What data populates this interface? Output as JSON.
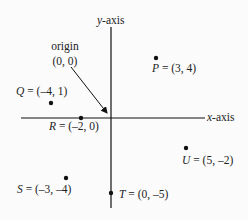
{
  "diagram": {
    "type": "coordinate-plane",
    "x_axis_label": "x-axis",
    "y_axis_label": "y-axis",
    "origin": {
      "label": "origin",
      "coords": "(0, 0)"
    },
    "scale_px_per_unit": 15,
    "origin_px": [
      111,
      118
    ],
    "points": [
      {
        "name": "P",
        "x": 3,
        "y": 4,
        "label_suffix": " = (3, 4)"
      },
      {
        "name": "Q",
        "x": -4,
        "y": 1,
        "label_suffix": " = (–4, 1)"
      },
      {
        "name": "R",
        "x": -2,
        "y": 0,
        "label_suffix": " = (–2, 0)"
      },
      {
        "name": "S",
        "x": -3,
        "y": -4,
        "label_suffix": " = (–3, –4)"
      },
      {
        "name": "T",
        "x": 0,
        "y": -5,
        "label_suffix": " = (0, –5)"
      },
      {
        "name": "U",
        "x": 5,
        "y": -2,
        "label_suffix": " = (5, –2)"
      }
    ]
  },
  "labels": {
    "x_axis_var": "x",
    "x_axis_rest": "-axis",
    "y_axis_var": "y",
    "y_axis_rest": "-axis",
    "origin_word": "origin",
    "origin_coords": "(0, 0)"
  }
}
